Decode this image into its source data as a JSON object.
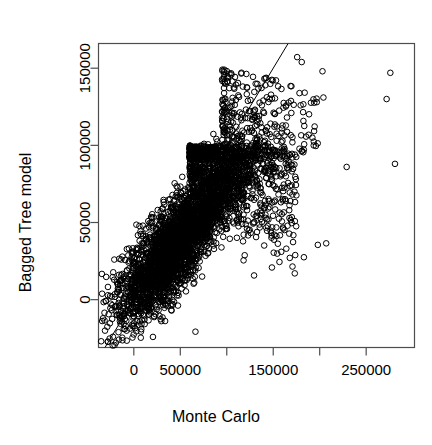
{
  "chart_data": {
    "type": "scatter",
    "title": "",
    "xlabel": "Monte Carlo",
    "ylabel": "Bagged Tree model",
    "xlim": [
      -38000,
      302000
    ],
    "ylim": [
      -31000,
      166000
    ],
    "grid": false,
    "legend": null,
    "marker": {
      "shape": "circle-open",
      "size_px": 5.6,
      "stroke": "#000000",
      "stroke_width": 1.0,
      "fill": "none"
    },
    "xticks": [
      0,
      50000,
      100000,
      150000,
      200000,
      250000
    ],
    "xtick_labels": [
      "0",
      "50000",
      "",
      "150000",
      "",
      "250000"
    ],
    "yticks": [
      0,
      50000,
      100000,
      150000
    ],
    "ytick_labels": [
      "0",
      "50000",
      "100000",
      "150000"
    ],
    "reference_line": {
      "type": "identity",
      "slope": 1,
      "intercept": 0,
      "color": "#000000",
      "width": 1.0
    },
    "n_points": 4200,
    "cloud": {
      "core": {
        "n": 3000,
        "x_center": 48000,
        "y_center": 38000,
        "major_axis_angle_deg": 38,
        "major_sigma": 46000,
        "minor_sigma": 12000
      },
      "fan": {
        "n": 900,
        "x_range": [
          60000,
          175000
        ],
        "y_range": [
          15000,
          100000
        ]
      },
      "upper_tail": {
        "n": 220,
        "x_range": [
          95000,
          200000
        ],
        "y_range": [
          95000,
          150000
        ]
      },
      "outliers": [
        {
          "x": 198000,
          "y": 35500
        },
        {
          "x": 207000,
          "y": 36500
        },
        {
          "x": 203000,
          "y": 148000
        },
        {
          "x": 204000,
          "y": 131000
        },
        {
          "x": 229000,
          "y": 86000
        },
        {
          "x": 276000,
          "y": 147000
        },
        {
          "x": 272000,
          "y": 130000
        },
        {
          "x": 281000,
          "y": 88000
        },
        {
          "x": 183000,
          "y": 27500
        }
      ]
    }
  },
  "axes": {
    "x_title": "Monte Carlo",
    "y_title": "Bagged Tree model",
    "x_tick_labels": [
      "0",
      "50000",
      "150000",
      "250000"
    ],
    "y_tick_labels": [
      "0",
      "50000",
      "100000",
      "150000"
    ]
  },
  "colors": {
    "foreground": "#000000",
    "background": "#ffffff",
    "axis": "#4d4d4d"
  }
}
